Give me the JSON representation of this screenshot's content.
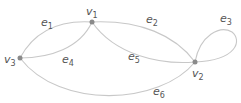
{
  "graph": {
    "title": "",
    "nodes": [
      {
        "id": "v1",
        "label": "v",
        "sub": "1"
      },
      {
        "id": "v2",
        "label": "v",
        "sub": "2"
      },
      {
        "id": "v3",
        "label": "v",
        "sub": "3"
      }
    ],
    "edges": [
      {
        "id": "e1",
        "label": "e",
        "sub": "1",
        "from": "v3",
        "to": "v1"
      },
      {
        "id": "e2",
        "label": "e",
        "sub": "2",
        "from": "v1",
        "to": "v2"
      },
      {
        "id": "e3",
        "label": "e",
        "sub": "3",
        "from": "v2",
        "to": "v2",
        "loop": true
      },
      {
        "id": "e4",
        "label": "e",
        "sub": "4",
        "from": "v3",
        "to": "v1"
      },
      {
        "id": "e5",
        "label": "e",
        "sub": "5",
        "from": "v1",
        "to": "v2"
      },
      {
        "id": "e6",
        "label": "e",
        "sub": "6",
        "from": "v3",
        "to": "v2"
      }
    ],
    "colors": {
      "edge": "#c8c8c8",
      "node": "#8a8a8a",
      "label": "#555555"
    }
  }
}
